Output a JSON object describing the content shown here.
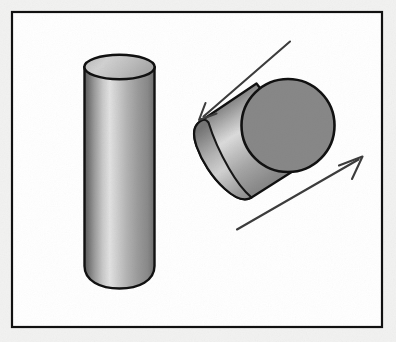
{
  "figure": {
    "title": "Rotation of a cylinder about its longitudinal axis",
    "width": 396,
    "height": 342,
    "page_background": "#f2f2f1",
    "panel": {
      "background": "#ffffff",
      "border_color": "#111111",
      "border_width": 2,
      "x": 11,
      "y": 11,
      "width": 372,
      "height": 317
    },
    "objects": [
      {
        "name": "upright-cylinder",
        "kind": "cylinder",
        "orientation": "vertical",
        "outline_color": "#111111",
        "top_cap_fill": "#c9c9c9",
        "body_gradient": [
          "#5c5c5c",
          "#9a9a9a",
          "#e2e2e2",
          "#b4b4b4",
          "#8a8a8a",
          "#6f6f6f"
        ],
        "left": 84,
        "right": 155,
        "top": 55,
        "bottom": 287,
        "cap_rx": 35.5,
        "cap_ry": 12
      },
      {
        "name": "tilted-cylinder",
        "kind": "cylinder",
        "orientation": "tilted-45-degrees",
        "outline_color": "#111111",
        "front_face_fill": "#888888",
        "body_gradient": [
          "#6a6a6a",
          "#9d9d9d",
          "#dcdcdc",
          "#b0b0b0",
          "#8d8d8d"
        ],
        "front_center_x": 288,
        "front_center_y": 125,
        "front_radius": 47,
        "back_center_x": 222,
        "back_center_y": 168,
        "axis_angle_degrees": 33
      }
    ],
    "annotations": [
      {
        "name": "rotation-arrow-upper-left",
        "kind": "arrow",
        "direction": "down-left",
        "color": "#3c3c3c",
        "from_x": 289,
        "from_y": 42,
        "to_x": 199,
        "to_y": 120
      },
      {
        "name": "rotation-arrow-lower-right",
        "kind": "arrow",
        "direction": "up-right",
        "color": "#3c3c3c",
        "from_x": 238,
        "from_y": 229,
        "to_x": 362,
        "to_y": 157
      }
    ]
  }
}
